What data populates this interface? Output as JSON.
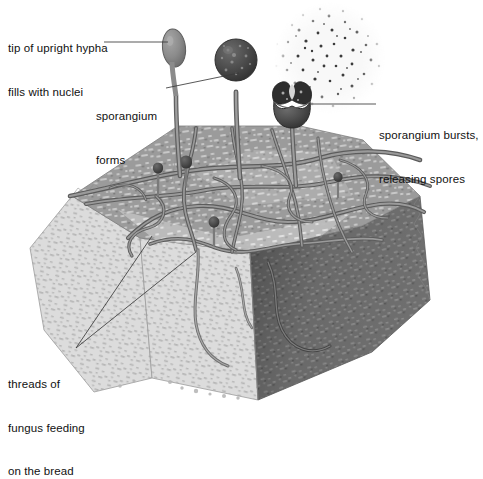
{
  "diagram": {
    "labels": [
      {
        "id": "tip-of-upright-hypha",
        "line1": "tip of upright hypha",
        "line2": "fills with nuclei",
        "text": "tip of upright hypha\nfills with nuclei",
        "points_to": "pale elongated sporangium tip at top left of block"
      },
      {
        "id": "sporangium-forms",
        "line1": "sporangium",
        "line2": "forms",
        "text": "sporangium\nforms",
        "points_to": "dark round sporangium on upright stalk"
      },
      {
        "id": "sporangium-bursts",
        "line1": "sporangium bursts,",
        "line2": "releasing spores",
        "text": "sporangium bursts,\nreleasing spores",
        "points_to": "split open sporangium cup releasing spore cloud"
      },
      {
        "id": "threads-of-fungus",
        "line1": "threads of",
        "line2": "fungus feeding",
        "line3": "on the bread",
        "text": "threads of\nfungus feeding\non the bread",
        "points_to": "hyphae threads running across and into the bread"
      }
    ],
    "elements": {
      "bread_block": "three-dimensional slice of bread, porous crumb texture",
      "top_face": "mid grey speckled crumb surface covered by hyphae network",
      "left_face": "pale light grey cut face of bread",
      "right_face": "dark shadowed cut face of bread",
      "hyphae": "network of grey tubular threads spreading over and through the bread",
      "sporangiophore_1": "upright hypha with swollen pale tip filling with nuclei",
      "sporangiophore_2": "upright hypha bearing a dark mature round sporangium",
      "sporangiophore_3": "upright hypha bearing a burst sporangium",
      "spore_cloud": "diffuse cloud of dark dots released from the burst sporangium",
      "small_sporangia": "several small dark sporangium buds on short stalks over the crumb"
    },
    "colors": {
      "background": "#ffffff",
      "bread_top": "#9b9b9b",
      "bread_top_light": "#c3c3c3",
      "bread_left": "#dcdcdc",
      "bread_right": "#6f6f6f",
      "hypha": "#7f7f7f",
      "hypha_outline": "#5a5a5a",
      "sporangium_dark": "#4a4a4a",
      "sporangium_pale": "#8c8c8c",
      "spore": "#3b3b3b",
      "leader_line": "#3a3a3a",
      "text": "#111111"
    }
  }
}
